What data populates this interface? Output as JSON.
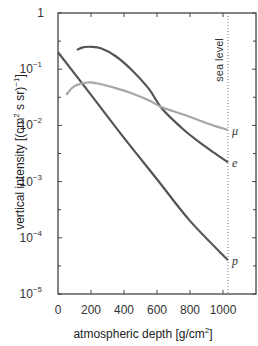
{
  "chart_data": {
    "type": "line",
    "title": "",
    "xlabel": "atmospheric depth [g/cm²]",
    "ylabel": "vertical intensity [(cm² s sr)⁻¹]",
    "xlim": [
      0,
      1200
    ],
    "ylim": [
      1e-05,
      1
    ],
    "yscale": "log",
    "grid": false,
    "x_ticks": [
      0,
      200,
      400,
      600,
      800,
      1000
    ],
    "x_tick_labels": [
      "0",
      "200",
      "400",
      "600",
      "800",
      "1000"
    ],
    "y_ticks": [
      1,
      0.1,
      0.01,
      0.001,
      0.0001,
      1e-05
    ],
    "y_tick_labels": [
      {
        "base": "1",
        "exp": ""
      },
      {
        "base": "10",
        "exp": "−1"
      },
      {
        "base": "10",
        "exp": "−2"
      },
      {
        "base": "10",
        "exp": "−3"
      },
      {
        "base": "10",
        "exp": "−4"
      },
      {
        "base": "10",
        "exp": "−5"
      }
    ],
    "annotations": [
      {
        "type": "vline",
        "x": 1030,
        "style": "dotted",
        "label": "sea level"
      }
    ],
    "series": [
      {
        "name": "p",
        "color": "#555555",
        "x": [
          0,
          200,
          400,
          600,
          800,
          1030
        ],
        "values": [
          0.2,
          0.035,
          0.006,
          0.0011,
          0.0002,
          4e-05
        ]
      },
      {
        "name": "e",
        "color": "#555555",
        "x": [
          115,
          150,
          200,
          260,
          350,
          450,
          550,
          630,
          750,
          850,
          950,
          1030
        ],
        "values": [
          0.22,
          0.245,
          0.25,
          0.235,
          0.17,
          0.095,
          0.045,
          0.02,
          0.009,
          0.0052,
          0.0032,
          0.0022
        ]
      },
      {
        "name": "μ",
        "color": "#a6a6a6",
        "x": [
          50,
          100,
          180,
          260,
          350,
          450,
          550,
          630,
          750,
          850,
          950,
          1030
        ],
        "values": [
          0.035,
          0.05,
          0.058,
          0.054,
          0.046,
          0.037,
          0.028,
          0.021,
          0.016,
          0.0125,
          0.0098,
          0.0083
        ]
      }
    ],
    "legend": "inline labels at right end of curves"
  },
  "labels": {
    "sea_level": "sea level",
    "xlabel_main": "atmospheric depth [g/cm",
    "xlabel_sup": "2",
    "xlabel_end": "]",
    "ylabel_main": "vertical intensity [(cm",
    "ylabel_sup": "2",
    "ylabel_mid": " s sr)",
    "ylabel_sup2": "−1",
    "ylabel_end": "]"
  }
}
